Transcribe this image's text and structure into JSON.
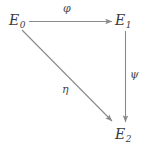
{
  "diagram": {
    "type": "commutative-diagram",
    "background_color": "#ffffff",
    "arrow_color": "#8a8a8a",
    "label_color": "#3a3a3a",
    "nodes": [
      {
        "id": "E0",
        "base": "E",
        "subscript": "0",
        "x": 22,
        "y": 21
      },
      {
        "id": "E1",
        "base": "E",
        "subscript": "1",
        "x": 122,
        "y": 21
      },
      {
        "id": "E2",
        "base": "E",
        "subscript": "2",
        "x": 122,
        "y": 134
      }
    ],
    "edges": [
      {
        "id": "phi",
        "label": "φ",
        "from": "E0",
        "to": "E1",
        "direction": "horizontal-right"
      },
      {
        "id": "psi",
        "label": "ψ",
        "from": "E1",
        "to": "E2",
        "direction": "vertical-down"
      },
      {
        "id": "eta",
        "label": "η",
        "from": "E0",
        "to": "E2",
        "direction": "diagonal-down-right"
      }
    ]
  }
}
